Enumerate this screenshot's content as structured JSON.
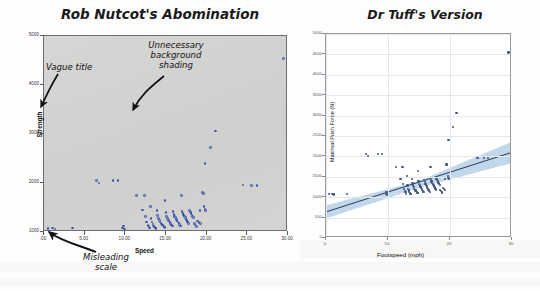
{
  "page": {
    "background_color": "#fdfdfd",
    "width": 540,
    "height": 291
  },
  "left_panel": {
    "title": "Rob Nutcot's Abomination",
    "annotations": [
      {
        "name": "vague-title",
        "text": "Vague title"
      },
      {
        "name": "background-shading",
        "text": "Unnecessary\nbackground\nshading"
      },
      {
        "name": "misleading-scale",
        "text": "Misleading\nscale"
      }
    ]
  },
  "right_panel": {
    "title": "Dr Tuff's Version"
  },
  "chart_data": [
    {
      "name": "rob-nutcot-abomination",
      "type": "scatter",
      "title": "Rob Nutcot's Abomination",
      "xlabel": "Speed",
      "ylabel": "Strength",
      "xlim": [
        0,
        30
      ],
      "ylim": [
        1000,
        5000
      ],
      "grid": false,
      "background_shading": true,
      "legend": "none",
      "xticks": [
        ".00",
        "5.00",
        "10.00",
        "15.00",
        "20.00",
        "25.00",
        "30.00"
      ],
      "xtick_values": [
        0,
        5,
        10,
        15,
        20,
        25,
        30
      ],
      "yticks": [
        "1000",
        "2000",
        "3000",
        "4000",
        "5000"
      ],
      "ytick_values": [
        1000,
        2000,
        3000,
        4000,
        5000
      ],
      "marker_fill": "#8d9ed6",
      "marker_edge": "#3c4fa0",
      "points": [
        [
          0.6,
          1050
        ],
        [
          1.2,
          1060
        ],
        [
          1.5,
          1040
        ],
        [
          3.6,
          1060
        ],
        [
          6.6,
          2030
        ],
        [
          6.9,
          1980
        ],
        [
          8.6,
          2030
        ],
        [
          9.2,
          2030
        ],
        [
          9.8,
          1060
        ],
        [
          9.9,
          1100
        ],
        [
          10.0,
          1040
        ],
        [
          11.5,
          1720
        ],
        [
          12.2,
          1430
        ],
        [
          12.5,
          1720
        ],
        [
          12.6,
          1300
        ],
        [
          12.7,
          1180
        ],
        [
          12.9,
          1120
        ],
        [
          13.0,
          1100
        ],
        [
          13.1,
          1060
        ],
        [
          13.2,
          1500
        ],
        [
          13.3,
          1260
        ],
        [
          13.4,
          1180
        ],
        [
          13.5,
          1140
        ],
        [
          13.6,
          1100
        ],
        [
          13.7,
          1080
        ],
        [
          13.8,
          1060
        ],
        [
          13.9,
          1050
        ],
        [
          14.0,
          1420
        ],
        [
          14.1,
          1320
        ],
        [
          14.2,
          1260
        ],
        [
          14.3,
          1220
        ],
        [
          14.4,
          1180
        ],
        [
          14.5,
          1160
        ],
        [
          14.6,
          1140
        ],
        [
          14.7,
          1120
        ],
        [
          14.8,
          1100
        ],
        [
          14.9,
          1080
        ],
        [
          15.0,
          1620
        ],
        [
          15.0,
          1070
        ],
        [
          15.1,
          1380
        ],
        [
          15.2,
          1300
        ],
        [
          15.3,
          1260
        ],
        [
          15.4,
          1220
        ],
        [
          15.5,
          1200
        ],
        [
          15.6,
          1170
        ],
        [
          15.7,
          1150
        ],
        [
          15.8,
          1120
        ],
        [
          15.9,
          1100
        ],
        [
          16.0,
          1400
        ],
        [
          16.1,
          1340
        ],
        [
          16.2,
          1300
        ],
        [
          16.3,
          1270
        ],
        [
          16.4,
          1240
        ],
        [
          16.5,
          1210
        ],
        [
          16.6,
          1180
        ],
        [
          16.7,
          1160
        ],
        [
          16.8,
          1130
        ],
        [
          16.9,
          1100
        ],
        [
          17.0,
          1720
        ],
        [
          17.1,
          1400
        ],
        [
          17.2,
          1360
        ],
        [
          17.3,
          1330
        ],
        [
          17.4,
          1300
        ],
        [
          17.5,
          1270
        ],
        [
          17.6,
          1240
        ],
        [
          17.7,
          1210
        ],
        [
          17.8,
          1180
        ],
        [
          17.9,
          1150
        ],
        [
          18.0,
          1420
        ],
        [
          18.1,
          1390
        ],
        [
          18.2,
          1360
        ],
        [
          18.3,
          1330
        ],
        [
          18.4,
          1300
        ],
        [
          18.5,
          1270
        ],
        [
          18.6,
          1150
        ],
        [
          18.7,
          1120
        ],
        [
          18.9,
          1090
        ],
        [
          19.0,
          1200
        ],
        [
          19.2,
          1170
        ],
        [
          19.3,
          1420
        ],
        [
          19.4,
          1150
        ],
        [
          19.6,
          1780
        ],
        [
          19.7,
          1760
        ],
        [
          19.8,
          1500
        ],
        [
          19.9,
          1440
        ],
        [
          20.0,
          1420
        ],
        [
          19.9,
          2380
        ],
        [
          20.6,
          2700
        ],
        [
          21.2,
          3040
        ],
        [
          24.6,
          1940
        ],
        [
          25.6,
          1930
        ],
        [
          26.3,
          1930
        ],
        [
          29.6,
          4520
        ]
      ]
    },
    {
      "name": "dr-tuff-version",
      "type": "scatter",
      "title": "Dr Tuff's Version",
      "xlabel": "Footspeed (mph)",
      "ylabel": "Maximal Push Force (N)",
      "xlim": [
        0,
        30
      ],
      "ylim": [
        0,
        5000
      ],
      "grid": true,
      "background_shading": false,
      "legend": "none",
      "xticks": [
        "0",
        "10",
        "20",
        "30"
      ],
      "xtick_values": [
        0,
        10,
        20,
        30
      ],
      "yticks": [
        "0",
        "500",
        "1000",
        "1500",
        "2000",
        "2500",
        "3000",
        "3500",
        "4000",
        "4500",
        "5000"
      ],
      "ytick_values": [
        0,
        500,
        1000,
        1500,
        2000,
        2500,
        3000,
        3500,
        4000,
        4500,
        5000
      ],
      "marker_color": "#46557f",
      "fit_line": {
        "name": "linear-regression",
        "color": "#2b3a5e",
        "x": [
          0,
          30
        ],
        "y": [
          640,
          2100
        ]
      },
      "confidence_band": {
        "name": "confidence-interval",
        "color": "#b6d0e6",
        "x": [
          0,
          15,
          30
        ],
        "lower": [
          480,
          1230,
          1840
        ],
        "upper": [
          800,
          1400,
          2360
        ]
      },
      "points": [
        [
          0.6,
          1050
        ],
        [
          1.2,
          1060
        ],
        [
          1.5,
          1040
        ],
        [
          3.6,
          1060
        ],
        [
          6.6,
          2030
        ],
        [
          6.9,
          1980
        ],
        [
          8.6,
          2030
        ],
        [
          9.2,
          2030
        ],
        [
          9.8,
          1060
        ],
        [
          9.9,
          1100
        ],
        [
          10.0,
          1040
        ],
        [
          11.5,
          1720
        ],
        [
          12.2,
          1430
        ],
        [
          12.5,
          1720
        ],
        [
          12.6,
          1300
        ],
        [
          12.7,
          1180
        ],
        [
          12.9,
          1120
        ],
        [
          13.0,
          1100
        ],
        [
          13.1,
          1060
        ],
        [
          13.2,
          1500
        ],
        [
          13.3,
          1260
        ],
        [
          13.4,
          1180
        ],
        [
          13.5,
          1140
        ],
        [
          13.6,
          1100
        ],
        [
          13.7,
          1080
        ],
        [
          13.8,
          1060
        ],
        [
          13.9,
          1050
        ],
        [
          14.0,
          1420
        ],
        [
          14.1,
          1320
        ],
        [
          14.2,
          1260
        ],
        [
          14.3,
          1220
        ],
        [
          14.4,
          1180
        ],
        [
          14.5,
          1160
        ],
        [
          14.6,
          1140
        ],
        [
          14.7,
          1120
        ],
        [
          14.8,
          1100
        ],
        [
          14.9,
          1080
        ],
        [
          15.0,
          1620
        ],
        [
          15.0,
          1070
        ],
        [
          15.1,
          1380
        ],
        [
          15.2,
          1300
        ],
        [
          15.3,
          1260
        ],
        [
          15.4,
          1220
        ],
        [
          15.5,
          1200
        ],
        [
          15.6,
          1170
        ],
        [
          15.7,
          1150
        ],
        [
          15.8,
          1120
        ],
        [
          15.9,
          1100
        ],
        [
          16.0,
          1400
        ],
        [
          16.1,
          1340
        ],
        [
          16.2,
          1300
        ],
        [
          16.3,
          1270
        ],
        [
          16.4,
          1240
        ],
        [
          16.5,
          1210
        ],
        [
          16.6,
          1180
        ],
        [
          16.7,
          1160
        ],
        [
          16.8,
          1130
        ],
        [
          16.9,
          1100
        ],
        [
          17.0,
          1720
        ],
        [
          17.1,
          1400
        ],
        [
          17.2,
          1360
        ],
        [
          17.3,
          1330
        ],
        [
          17.4,
          1300
        ],
        [
          17.5,
          1270
        ],
        [
          17.6,
          1240
        ],
        [
          17.7,
          1210
        ],
        [
          17.8,
          1180
        ],
        [
          17.9,
          1150
        ],
        [
          18.0,
          1420
        ],
        [
          18.1,
          1390
        ],
        [
          18.2,
          1360
        ],
        [
          18.3,
          1330
        ],
        [
          18.4,
          1300
        ],
        [
          18.5,
          1270
        ],
        [
          18.6,
          1150
        ],
        [
          18.7,
          1120
        ],
        [
          18.9,
          1090
        ],
        [
          19.0,
          1200
        ],
        [
          19.2,
          1170
        ],
        [
          19.3,
          1420
        ],
        [
          19.4,
          1150
        ],
        [
          19.6,
          1780
        ],
        [
          19.7,
          1760
        ],
        [
          19.8,
          1500
        ],
        [
          19.9,
          1440
        ],
        [
          20.0,
          1420
        ],
        [
          19.9,
          2380
        ],
        [
          20.6,
          2700
        ],
        [
          21.2,
          3040
        ],
        [
          24.6,
          1940
        ],
        [
          25.6,
          1930
        ],
        [
          26.3,
          1930
        ],
        [
          29.6,
          4520
        ]
      ]
    }
  ]
}
